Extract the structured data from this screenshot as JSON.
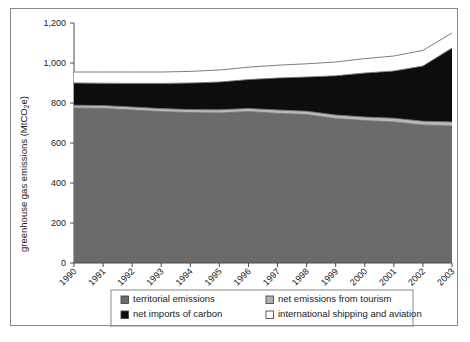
{
  "chart_data": {
    "type": "area",
    "stacked": true,
    "title": "",
    "xlabel": "",
    "ylabel": "greenhouse gas emissions (MtCO₂e)",
    "ylabel_plain": "greenhouse gas emissions (MtCO2e)",
    "ylim": [
      0,
      1200
    ],
    "yticks": [
      0,
      200,
      400,
      600,
      800,
      1000,
      1200
    ],
    "ytick_labels": [
      "0",
      "200",
      "400",
      "600",
      "800",
      "1,000",
      "1,200"
    ],
    "grid": false,
    "legend_position": "bottom",
    "categories": [
      "1990",
      "1991",
      "1992",
      "1993",
      "1994",
      "1995",
      "1996",
      "1997",
      "1998",
      "1999",
      "2000",
      "2001",
      "2002",
      "2003"
    ],
    "series": [
      {
        "name": "territorial emissions",
        "color": "#6b6b6b",
        "values": [
          775,
          773,
          765,
          757,
          752,
          750,
          757,
          748,
          742,
          722,
          712,
          705,
          690,
          685
        ]
      },
      {
        "name": "net emissions from tourism",
        "color": "#b8b8b8",
        "values": [
          14,
          14,
          15,
          15,
          15,
          16,
          16,
          17,
          17,
          18,
          18,
          19,
          19,
          20
        ]
      },
      {
        "name": "net imports of carbon",
        "color": "#0d0d0d",
        "values": [
          111,
          112,
          118,
          126,
          133,
          139,
          144,
          160,
          171,
          196,
          220,
          236,
          276,
          370
        ]
      },
      {
        "name": "international shipping and aviation",
        "color": "#ffffff",
        "values": [
          55,
          56,
          57,
          57,
          58,
          60,
          62,
          64,
          66,
          69,
          72,
          75,
          78,
          75
        ]
      }
    ],
    "totals": [
      955,
      955,
      955,
      955,
      958,
      965,
      979,
      989,
      996,
      1005,
      1022,
      1035,
      1063,
      1150
    ]
  },
  "legend": {
    "items": [
      {
        "label": "territorial emissions",
        "swatch": "dark-gray",
        "color": "#6b6b6b"
      },
      {
        "label": "net emissions from tourism",
        "swatch": "light-gray",
        "color": "#b0b0b0"
      },
      {
        "label": "net imports of carbon",
        "swatch": "black",
        "color": "#0d0d0d"
      },
      {
        "label": "international shipping and aviation",
        "swatch": "white",
        "color": "#ffffff"
      }
    ]
  }
}
